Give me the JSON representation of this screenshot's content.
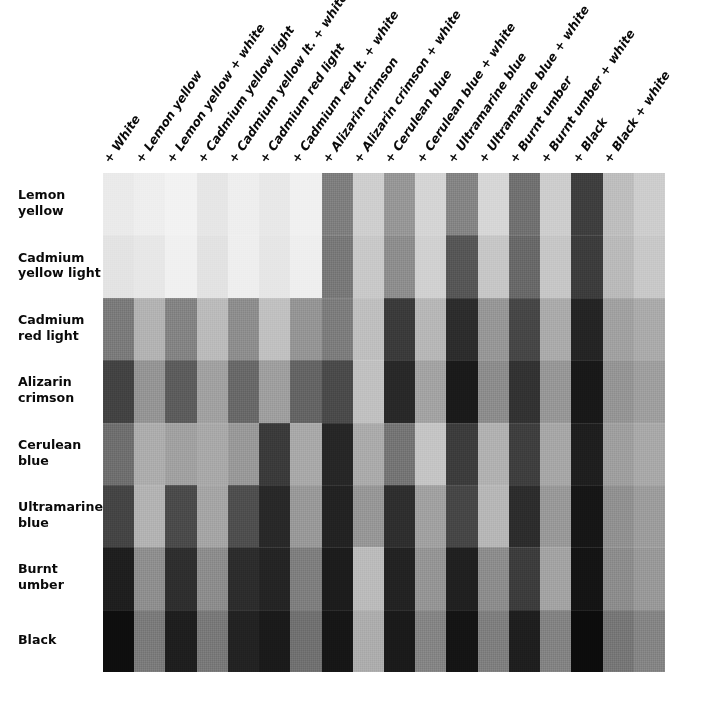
{
  "figure": {
    "kind": "paint-color-mixing-grid",
    "background_color": "#ffffff",
    "grid": {
      "rows": 8,
      "columns": 18
    }
  },
  "row_labels": [
    "Lemon\nyellow",
    "Cadmium\nyellow light",
    "Cadmium\nred light",
    "Alizarin\ncrimson",
    "Cerulean\nblue",
    "Ultramarine\nblue",
    "Burnt\number",
    "Black"
  ],
  "column_labels": [
    "+ White",
    "+ Lemon yellow",
    "+ Lemon yellow + white",
    "+ Cadmium yellow light",
    "+ Cadmium yellow lt. + white",
    "+ Cadmium red light",
    "+ Cadmium red lt. + white",
    "+ Alizarin crimson",
    "+ Alizarin crimson + white",
    "+ Cerulean blue",
    "+ Cerulean blue + white",
    "+ Ultramarine blue",
    "+ Ultramarine blue + white",
    "+ Burnt umber",
    "+ Burnt umber + white",
    "+ Black",
    "+ Black + white",
    ""
  ],
  "chart_data": {
    "type": "heatmap",
    "title": "",
    "xlabel": "",
    "ylabel": "",
    "grid": false,
    "legend": "none",
    "row_categories": [
      "Lemon yellow",
      "Cadmium yellow light",
      "Cadmium red light",
      "Alizarin crimson",
      "Cerulean blue",
      "Ultramarine blue",
      "Burnt umber",
      "Black"
    ],
    "column_categories": [
      "+ White",
      "+ Lemon yellow",
      "+ Lemon yellow + white",
      "+ Cadmium yellow light",
      "+ Cadmium yellow lt. + white",
      "+ Cadmium red light",
      "+ Cadmium red lt. + white",
      "+ Alizarin crimson",
      "+ Alizarin crimson + white",
      "+ Cerulean blue",
      "+ Cerulean blue + white",
      "+ Ultramarine blue",
      "+ Ultramarine blue + white",
      "+ Burnt umber",
      "+ Burnt umber + white",
      "+ Black",
      "+ Black + white",
      "(last swatch column)"
    ],
    "value_unit": "grayscale luminance 0-255",
    "values": [
      [
        234,
        238,
        242,
        230,
        238,
        232,
        240,
        126,
        206,
        150,
        212,
        132,
        214,
        112,
        205,
        62,
        189,
        205
      ],
      [
        227,
        231,
        240,
        226,
        238,
        230,
        238,
        120,
        200,
        141,
        208,
        86,
        198,
        104,
        198,
        60,
        185,
        200
      ],
      [
        122,
        178,
        131,
        186,
        141,
        192,
        148,
        124,
        190,
        58,
        182,
        44,
        150,
        70,
        170,
        36,
        160,
        170
      ],
      [
        66,
        148,
        92,
        160,
        104,
        158,
        100,
        74,
        192,
        40,
        162,
        26,
        140,
        50,
        150,
        24,
        148,
        158
      ],
      [
        110,
        172,
        160,
        168,
        152,
        58,
        168,
        38,
        170,
        116,
        196,
        60,
        176,
        62,
        166,
        30,
        158,
        168
      ],
      [
        68,
        178,
        74,
        164,
        78,
        40,
        152,
        34,
        150,
        46,
        160,
        70,
        182,
        44,
        152,
        22,
        144,
        156
      ],
      [
        30,
        142,
        46,
        140,
        44,
        36,
        126,
        28,
        186,
        34,
        148,
        32,
        140,
        60,
        162,
        20,
        140,
        152
      ],
      [
        14,
        122,
        30,
        120,
        34,
        26,
        112,
        22,
        172,
        26,
        132,
        20,
        126,
        30,
        130,
        12,
        118,
        132
      ]
    ],
    "swatch_hex": [
      [
        "#eaeaea",
        "#eeeeee",
        "#f2f2f2",
        "#e6e6e6",
        "#eeeeee",
        "#e8e8e8",
        "#f0f0f0",
        "#7e7e7e",
        "#cecece",
        "#969696",
        "#d4d4d4",
        "#848484",
        "#d6d6d6",
        "#707070",
        "#cdcdcd",
        "#3e3e3e",
        "#bdbdbd",
        "#cdcdcd"
      ],
      [
        "#e3e3e3",
        "#e7e7e7",
        "#f0f0f0",
        "#e2e2e2",
        "#eeeeee",
        "#e6e6e6",
        "#eeeeee",
        "#787878",
        "#c8c8c8",
        "#8d8d8d",
        "#d0d0d0",
        "#565656",
        "#c6c6c6",
        "#686868",
        "#c6c6c6",
        "#3c3c3c",
        "#b9b9b9",
        "#c8c8c8"
      ],
      [
        "#7a7a7a",
        "#b2b2b2",
        "#838383",
        "#bababa",
        "#8d8d8d",
        "#c0c0c0",
        "#949494",
        "#7c7c7c",
        "#bebebe",
        "#3a3a3a",
        "#b6b6b6",
        "#2c2c2c",
        "#969696",
        "#464646",
        "#aaaaaa",
        "#242424",
        "#a0a0a0",
        "#aaaaaa"
      ],
      [
        "#424242",
        "#949494",
        "#5c5c5c",
        "#a0a0a0",
        "#686868",
        "#9e9e9e",
        "#646464",
        "#4a4a4a",
        "#c0c0c0",
        "#282828",
        "#a2a2a2",
        "#1a1a1a",
        "#8c8c8c",
        "#323232",
        "#969696",
        "#181818",
        "#949494",
        "#9e9e9e"
      ],
      [
        "#6e6e6e",
        "#acacac",
        "#a0a0a0",
        "#a8a8a8",
        "#989898",
        "#3a3a3a",
        "#a8a8a8",
        "#262626",
        "#aaaaaa",
        "#747474",
        "#c4c4c4",
        "#3c3c3c",
        "#b0b0b0",
        "#3e3e3e",
        "#a6a6a6",
        "#1e1e1e",
        "#9e9e9e",
        "#a8a8a8"
      ],
      [
        "#444444",
        "#b2b2b2",
        "#4a4a4a",
        "#a4a4a4",
        "#4e4e4e",
        "#282828",
        "#989898",
        "#222222",
        "#969696",
        "#2e2e2e",
        "#a0a0a0",
        "#464646",
        "#b6b6b6",
        "#2c2c2c",
        "#989898",
        "#161616",
        "#909090",
        "#9c9c9c"
      ],
      [
        "#1e1e1e",
        "#8e8e8e",
        "#2e2e2e",
        "#8c8c8c",
        "#2c2c2c",
        "#242424",
        "#7e7e7e",
        "#1c1c1c",
        "#bababa",
        "#222222",
        "#949494",
        "#202020",
        "#8c8c8c",
        "#3c3c3c",
        "#a2a2a2",
        "#141414",
        "#8c8c8c",
        "#989898"
      ],
      [
        "#0e0e0e",
        "#7a7a7a",
        "#1e1e1e",
        "#787878",
        "#222222",
        "#1a1a1a",
        "#707070",
        "#161616",
        "#acacac",
        "#1a1a1a",
        "#848484",
        "#141414",
        "#7e7e7e",
        "#1e1e1e",
        "#828282",
        "#0c0c0c",
        "#767676",
        "#848484"
      ]
    ]
  }
}
